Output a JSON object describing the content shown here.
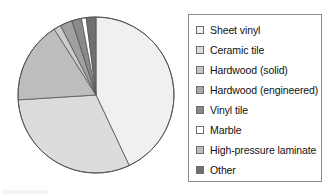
{
  "chart_data": {
    "type": "pie",
    "title": "",
    "subtitle": "",
    "xlabel": "",
    "ylabel": "",
    "grid": false,
    "legend_position": "right",
    "start_angle_deg": 0,
    "direction": "clockwise",
    "categories": [
      "Sheet vinyl",
      "Ceramic tile",
      "Hardwood (solid)",
      "Hardwood (engineered)",
      "Vinyl tile",
      "Marble",
      "High-pressure laminate",
      "Other"
    ],
    "values": [
      43,
      31,
      1.5,
      2.5,
      2,
      1,
      17,
      2
    ],
    "units": "percent",
    "slices": [
      {
        "label": "Sheet vinyl",
        "value": 43,
        "color": "#f0f0f0"
      },
      {
        "label": "Ceramic tile",
        "value": 31,
        "color": "#dcdcdc"
      },
      {
        "label": "High-pressure laminate",
        "value": 17,
        "color": "#bdbdbd"
      },
      {
        "label": "Hardwood (solid)",
        "value": 1.5,
        "color": "#cccccc"
      },
      {
        "label": "Hardwood (engineered)",
        "value": 2.5,
        "color": "#a0a0a0"
      },
      {
        "label": "Vinyl tile",
        "value": 2,
        "color": "#8a8a8a"
      },
      {
        "label": "Marble",
        "value": 1,
        "color": "#ffffff"
      },
      {
        "label": "Other",
        "value": 2,
        "color": "#707070"
      }
    ]
  },
  "legend": {
    "items": [
      {
        "label": "Sheet vinyl",
        "color": "#f0f0f0",
        "swatch_name": "legend-swatch-sheet-vinyl"
      },
      {
        "label": "Ceramic tile",
        "color": "#dcdcdc",
        "swatch_name": "legend-swatch-ceramic-tile"
      },
      {
        "label": "Hardwood (solid)",
        "color": "#c4c4c4",
        "swatch_name": "legend-swatch-hardwood-solid"
      },
      {
        "label": "Hardwood (engineered)",
        "color": "#a8a8a8",
        "swatch_name": "legend-swatch-hardwood-engineered"
      },
      {
        "label": "Vinyl tile",
        "color": "#8a8a8a",
        "swatch_name": "legend-swatch-vinyl-tile"
      },
      {
        "label": "Marble",
        "color": "#ffffff",
        "swatch_name": "legend-swatch-marble"
      },
      {
        "label": "High-pressure laminate",
        "color": "#bdbdbd",
        "swatch_name": "legend-swatch-high-pressure-laminate"
      },
      {
        "label": "Other",
        "color": "#707070",
        "swatch_name": "legend-swatch-other"
      }
    ]
  },
  "style": {
    "slice_outline": "#555555",
    "legend_border": "#8a8a8a",
    "background": "#ffffff",
    "text_color": "#111111"
  }
}
